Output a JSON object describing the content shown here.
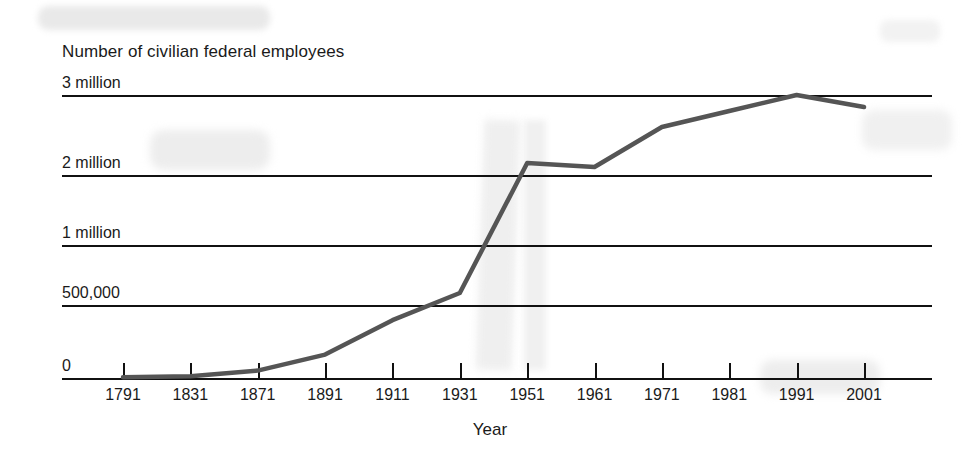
{
  "chart_data": {
    "type": "line",
    "title": "",
    "ylabel": "Number of civilian federal employees",
    "xlabel": "Year",
    "categories": [
      "1791",
      "1831",
      "1871",
      "1891",
      "1911",
      "1931",
      "1951",
      "1961",
      "1971",
      "1981",
      "1991",
      "2001"
    ],
    "values": [
      5000,
      12000,
      51000,
      160000,
      396000,
      600000,
      2150000,
      2100000,
      2600000,
      2800000,
      3000000,
      2850000
    ],
    "series": [
      {
        "name": "Civilian federal employees",
        "values": [
          5000,
          12000,
          51000,
          160000,
          396000,
          600000,
          2150000,
          2100000,
          2600000,
          2800000,
          3000000,
          2850000
        ]
      }
    ],
    "y_tick_labels": [
      "3 million",
      "2 million",
      "1 million",
      "500,000",
      "0"
    ],
    "y_tick_values": [
      3000000,
      2000000,
      1000000,
      500000,
      0
    ],
    "y_axis_scale": "non-linear",
    "ylim": [
      0,
      3000000
    ],
    "grid": true,
    "legend": false,
    "line_color": "#555555",
    "axis_color": "#111111"
  },
  "icons": {
    "scan-smudge": "scan-smudge"
  }
}
